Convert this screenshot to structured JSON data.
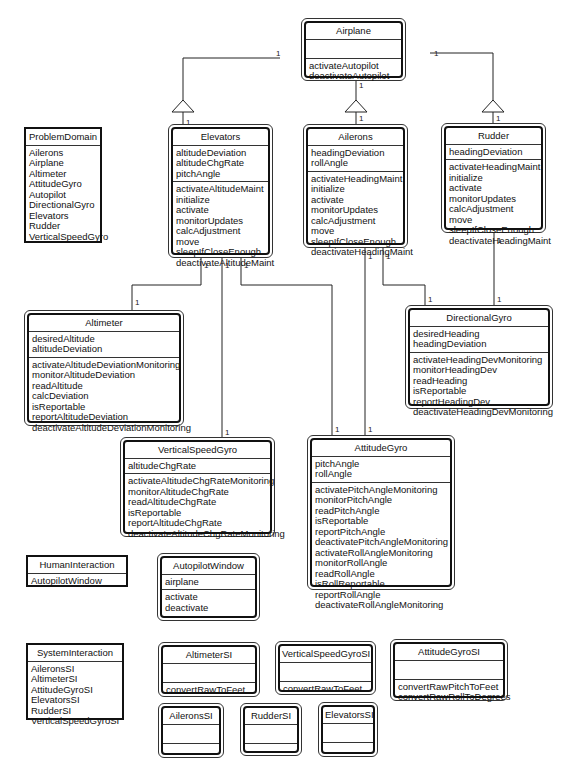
{
  "diagram": {
    "classes": {
      "airplane": {
        "name": "Airplane",
        "attributes": [],
        "services": [
          "activateAutopilot",
          "deactivateAutopilot"
        ]
      },
      "elevators": {
        "name": "Elevators",
        "attributes": [
          "altitudeDeviation",
          "altitudeChgRate",
          "pitchAngle"
        ],
        "services": [
          "activateAltitudeMaint",
          "initialize",
          "activate",
          "monitorUpdates",
          "calcAdjustment",
          "move",
          "sleepIfCloseEnough",
          "deactivateAltitudeMaint"
        ]
      },
      "ailerons": {
        "name": "Ailerons",
        "attributes": [
          "headingDeviation",
          "rollAngle"
        ],
        "services": [
          "activateHeadingMaint",
          "initialize",
          "activate",
          "monitorUpdates",
          "calcAdjustment",
          "move",
          "sleepIfCloseEnough",
          "deactivateHeadingMaint"
        ]
      },
      "rudder": {
        "name": "Rudder",
        "attributes": [
          "headingDeviation"
        ],
        "services": [
          "activateHeadingMaint",
          "initialize",
          "activate",
          "monitorUpdates",
          "calcAdjustment",
          "move",
          "sleepIfCloseEnough",
          "deactivateHeadingMaint"
        ]
      },
      "altimeter": {
        "name": "Altimeter",
        "attributes": [
          "desiredAltitude",
          "altitudeDeviation"
        ],
        "services": [
          "activateAltitudeDeviationMonitoring",
          "monitorAltitudeDeviation",
          "readAltitude",
          "calcDeviation",
          "isReportable",
          "reportAltitudeDeviation",
          "deactivateAltitudeDeviationMonitoring"
        ]
      },
      "directionalGyro": {
        "name": "DirectionalGyro",
        "attributes": [
          "desiredHeading",
          "headingDeviation"
        ],
        "services": [
          "activateHeadingDevMonitoring",
          "monitorHeadingDev",
          "readHeading",
          "isReportable",
          "reportHeadingDev",
          "deactivateHeadingDevMonitoring"
        ]
      },
      "verticalSpeedGyro": {
        "name": "VerticalSpeedGyro",
        "attributes": [
          "altitudeChgRate"
        ],
        "services": [
          "activateAltitudeChgRateMonitoring",
          "monitorAltitudeChgRate",
          "readAltitudeChgRate",
          "isReportable",
          "reportAltitudeChgRate",
          "deactivateAltitudeChgRateMonitoring"
        ]
      },
      "attitudeGyro": {
        "name": "AttitudeGyro",
        "attributes": [
          "pitchAngle",
          "rollAngle"
        ],
        "services": [
          "activatePitchAngleMonitoring",
          "monitorPitchAngle",
          "readPitchAngle",
          "isReportable",
          "reportPitchAngle",
          "deactivatePitchAngleMonitoring",
          "activateRollAngleMonitoring",
          "monitorRollAngle",
          "readRollAngle",
          "isRollReportable",
          "reportRollAngle",
          "deactivateRollAngleMonitoring"
        ]
      },
      "autopilotWindow": {
        "name": "AutopilotWindow",
        "attributes": [
          "airplane"
        ],
        "services": [
          "activate",
          "deactivate"
        ]
      },
      "altimeterSI": {
        "name": "AltimeterSI",
        "attributes": [],
        "services": [
          "convertRawToFeet"
        ]
      },
      "verticalSpeedGyroSI": {
        "name": "VerticalSpeedGyroSI",
        "attributes": [],
        "services": [
          "convertRawToFeet"
        ]
      },
      "attitudeGyroSI": {
        "name": "AttitudeGyroSI",
        "attributes": [],
        "services": [
          "convertRawPitchToFeet",
          "convertRawRollToDegrees"
        ]
      },
      "aileronsSI": {
        "name": "AileronsSI",
        "attributes": [],
        "services": []
      },
      "rudderSI": {
        "name": "RudderSI",
        "attributes": [],
        "services": []
      },
      "elevatorsSI": {
        "name": "ElevatorsSI",
        "attributes": [],
        "services": []
      }
    },
    "packages": {
      "problemDomain": {
        "name": "ProblemDomain",
        "items": [
          "Ailerons",
          "Airplane",
          "Altimeter",
          "AttitudeGyro",
          "Autopilot",
          "DirectionalGyro",
          "Elevators",
          "Rudder",
          "VerticalSpeedGyro"
        ]
      },
      "humanInteraction": {
        "name": "HumanInteraction",
        "items": [
          "AutopilotWindow"
        ]
      },
      "systemInteraction": {
        "name": "SystemInteraction",
        "items": [
          "AileronsSI",
          "AltimeterSI",
          "AttitudeGyroSI",
          "ElevatorsSI",
          "RudderSI",
          "VerticalSpeedGyroSI"
        ]
      }
    },
    "multiplicity": "1"
  }
}
